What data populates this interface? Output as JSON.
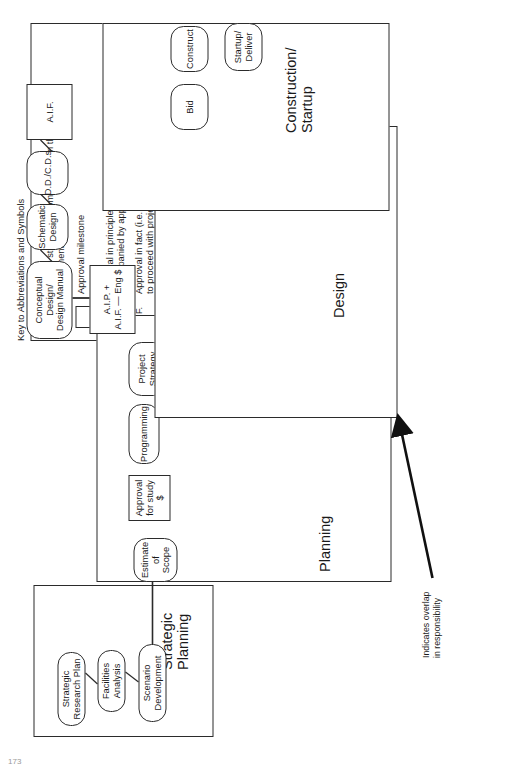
{
  "legend": {
    "title": "Key to Abbreviations and Symbols",
    "rows": [
      {
        "symbol": "pill-shape",
        "text": "Process step (Note some overlap in the major\nComponent groups)"
      },
      {
        "symbol": "rect-shape",
        "text": "Approval milestone"
      },
      {
        "symbol": "A.I.P.",
        "text": "Approval in principle (generally\naccompanied by approval of engineer $)"
      },
      {
        "symbol": "A.I.F.",
        "text": "Approval in fact (i.e. green light\nto proceed with project)"
      },
      {
        "symbol": "D.D.",
        "text": "Design Development"
      },
      {
        "symbol": "C.D.",
        "text": "Construction Documents"
      }
    ]
  },
  "groups": [
    {
      "key": "strategic_planning",
      "label": "Strategic\nPlanning"
    },
    {
      "key": "planning",
      "label": "Planning"
    },
    {
      "key": "design",
      "label": "Design"
    },
    {
      "key": "construction_startup",
      "label": "Construction/\nStartup"
    }
  ],
  "nodes": {
    "strategic_research_plan": "Strategic\nResearch Plan",
    "facilities_analysis": "Facilities\nAnalysis",
    "scenario_development": "Scenario\nDevelopment",
    "estimate_of_scope": "Estimate of\nScope",
    "approval_for_study": "Approval\nfor study $",
    "programming": "Programming",
    "project_strategy": "Project\nStrategy",
    "aip_aif_eng": "A.I.P. +\nA.I.F. — Eng $",
    "conceptual_design": "Conceptual Design/\nDesign Manual",
    "schematic_design": "Schematic\nDesign",
    "dd_cds": "D.D./C.D.s",
    "aif": "A.I.F.",
    "bid": "Bid",
    "construct": "Construct",
    "startup_deliver": "Startup/\nDeliver"
  },
  "annotation": {
    "overlap_note": "Indicates overlap\nin responsibility"
  },
  "page": {
    "number": "173"
  },
  "colors": {
    "stroke": "#2b2b2b",
    "background": "#ffffff",
    "text": "#1a1a1a"
  }
}
